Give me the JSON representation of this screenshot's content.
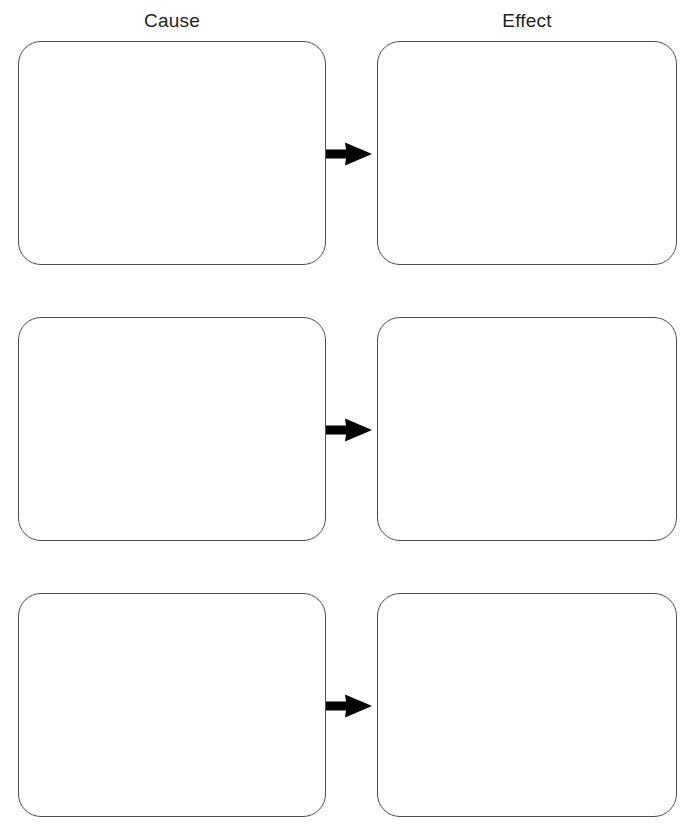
{
  "worksheet": {
    "title": "Cause and Effect Graphic Organizer",
    "background_color": "#ffffff",
    "box_border_color": "#4d4d4f",
    "arrow_color": "#000000",
    "text_color": "#231f20"
  },
  "headers": {
    "cause": "Cause",
    "effect": "Effect"
  },
  "rows": [
    {
      "cause": "",
      "effect": "",
      "arrow_icon": "arrow-right-icon"
    },
    {
      "cause": "",
      "effect": "",
      "arrow_icon": "arrow-right-icon"
    },
    {
      "cause": "",
      "effect": "",
      "arrow_icon": "arrow-right-icon"
    }
  ]
}
